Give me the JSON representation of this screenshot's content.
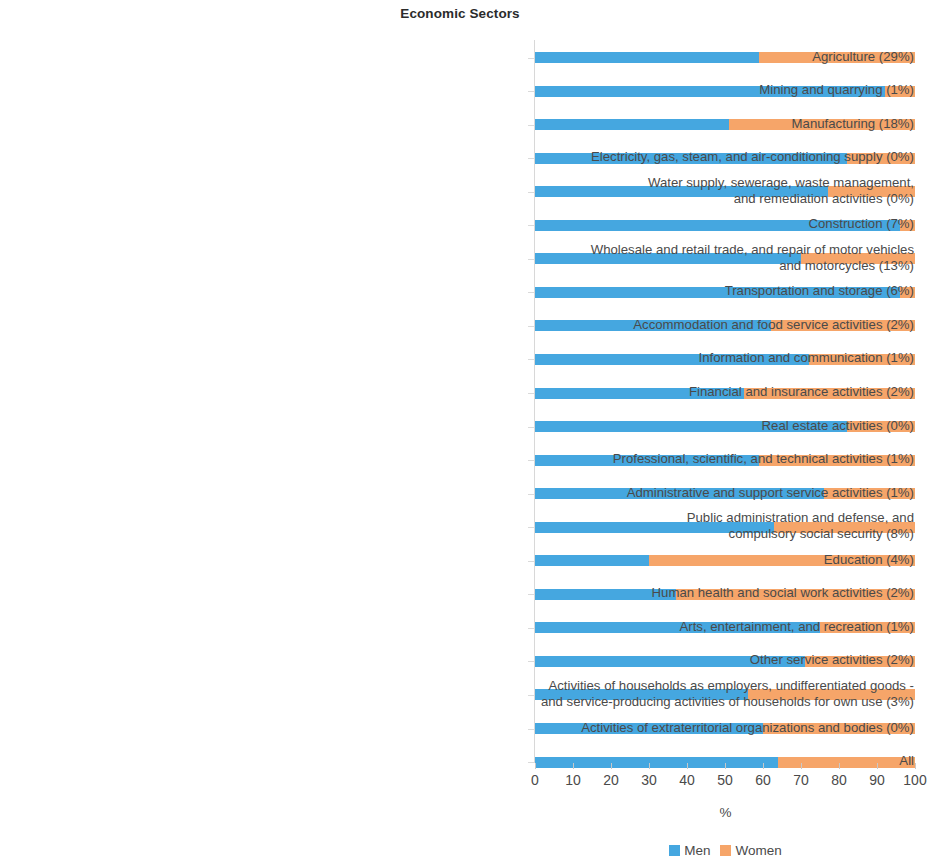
{
  "chart_data": {
    "type": "bar",
    "orientation": "horizontal",
    "stacked": true,
    "normalized": true,
    "title": "Economic Sectors",
    "xlabel": "%",
    "ylabel": "",
    "xlim": [
      0,
      100
    ],
    "xticks": [
      0,
      10,
      20,
      30,
      40,
      50,
      60,
      70,
      80,
      90,
      100
    ],
    "xtick_labels": [
      "0",
      "10",
      "20",
      "30",
      "40",
      "50",
      "60",
      "70",
      "80",
      "90",
      "100"
    ],
    "grid": false,
    "legend_position": "bottom",
    "legend": [
      "Men",
      "Women"
    ],
    "colors": {
      "men": "#45A7E0",
      "women": "#F6A569"
    },
    "categories": [
      "Agriculture (29%)",
      "Mining and quarrying (1%)",
      "Manufacturing (18%)",
      "Electricity, gas, steam, and air-conditioning supply (0%)",
      "Water supply, sewerage, waste management,\nand remediation activities (0%)",
      "Construction (7%)",
      "Wholesale and retail trade, and repair of motor vehicles\nand motorcycles (13%)",
      "Transportation and storage (6%)",
      "Accommodation and food service activities (2%)",
      "Information and communication (1%)",
      "Financial and insurance activities (2%)",
      "Real estate activities (0%)",
      "Professional, scientific, and technical activities (1%)",
      "Administrative and support service activities (1%)",
      "Public administration and defense, and\ncompulsory social security (8%)",
      "Education (4%)",
      "Human health and social work activities (2%)",
      "Arts, entertainment, and recreation (1%)",
      "Other service activities (2%)",
      "Activities of households as employers, undifferentiated goods -\nand service-producing activities of households for own use (3%)",
      "Activities of extraterritorial organizations and bodies (0%)",
      "All"
    ],
    "series": [
      {
        "name": "Men",
        "values": [
          59,
          92,
          51,
          82,
          77,
          96,
          70,
          96,
          62,
          72,
          55,
          82,
          59,
          76,
          63,
          30,
          37,
          75,
          71,
          56,
          60,
          64
        ]
      },
      {
        "name": "Women",
        "values": [
          41,
          8,
          49,
          18,
          23,
          4,
          30,
          4,
          38,
          28,
          45,
          18,
          41,
          24,
          37,
          70,
          63,
          25,
          29,
          44,
          40,
          36
        ]
      }
    ]
  }
}
